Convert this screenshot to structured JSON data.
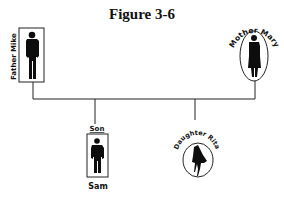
{
  "figure": {
    "title": "Figure 3-6",
    "type": "family genogram"
  },
  "members": [
    {
      "id": "father",
      "role": "Father",
      "name": "Mike",
      "label": "Father Mike",
      "shape": "rectangle",
      "gender": "male",
      "generation": 1
    },
    {
      "id": "mother",
      "role": "Mother",
      "name": "Mary",
      "label": "Mother Mary",
      "shape": "oval",
      "gender": "female",
      "generation": 1
    },
    {
      "id": "son",
      "role": "Son",
      "name": "Sam",
      "label_top": "Son",
      "label_bottom": "Sam",
      "shape": "rectangle",
      "gender": "male",
      "generation": 2
    },
    {
      "id": "daughter",
      "role": "Daughter",
      "name": "Rita",
      "label": "Daughter Rita",
      "shape": "oval",
      "gender": "female",
      "generation": 2
    }
  ],
  "relationships": [
    {
      "type": "marriage",
      "from": "father",
      "to": "mother"
    },
    {
      "type": "child",
      "parents": [
        "father",
        "mother"
      ],
      "child": "son"
    },
    {
      "type": "child",
      "parents": [
        "father",
        "mother"
      ],
      "child": "daughter"
    }
  ],
  "colors": {
    "line": "#222222",
    "silhouette": "#0d0d0d",
    "background": "#ffffff"
  }
}
